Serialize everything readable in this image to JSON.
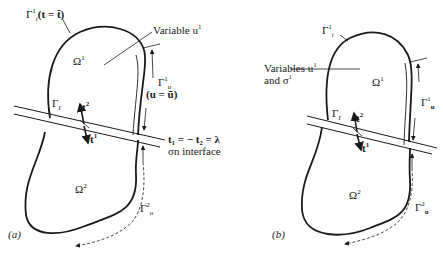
{
  "panels": [
    {
      "id": "a",
      "caption": "(a)",
      "labels": {
        "gamma_t": {
          "sym": "Γ",
          "sub": "t",
          "sup": "1",
          "rest": "(t = t̄)"
        },
        "variable": "Variable u",
        "variable_sup": "1",
        "omega1": {
          "sym": "Ω",
          "sup": "1"
        },
        "omega2": {
          "sym": "Ω",
          "sup": "2"
        },
        "gamma_u1": {
          "sym": "Γ",
          "sub": "u",
          "sup": "1",
          "cond": "(u = ū)"
        },
        "gamma_u2": {
          "sym": "Γ",
          "sub": "u",
          "sup": "2"
        },
        "gamma_I": {
          "sym": "Γ",
          "sub": "I"
        },
        "t2": {
          "sym": "t",
          "sup": "2"
        },
        "t1": {
          "sym": "t",
          "sup": "1"
        },
        "interface_eq": "t₁ = − t₂ = λ",
        "interface_note": "σn interface"
      }
    },
    {
      "id": "b",
      "caption": "(b)",
      "labels": {
        "gamma_t": {
          "sym": "Γ",
          "sub": "t",
          "sup": "1"
        },
        "variables_line1": "Variables u",
        "variables_sup": "1",
        "variables_line2": "and σ",
        "variables_line2_sup": "1",
        "omega1": {
          "sym": "Ω",
          "sup": "1"
        },
        "omega2": {
          "sym": "Ω",
          "sup": "2"
        },
        "gamma_u1": {
          "sym": "Γ",
          "sub": "u",
          "sup": "1"
        },
        "gamma_u2": {
          "sym": "Γ",
          "sub": "u",
          "sup": "2"
        },
        "gamma_I": {
          "sym": "Γ",
          "sub": "I"
        },
        "t2": {
          "sym": "t",
          "sup": "2"
        },
        "t1": {
          "sym": "t",
          "sup": "1"
        }
      }
    }
  ],
  "colors": {
    "stroke": "#1a1a1a",
    "background": "#ffffff"
  }
}
